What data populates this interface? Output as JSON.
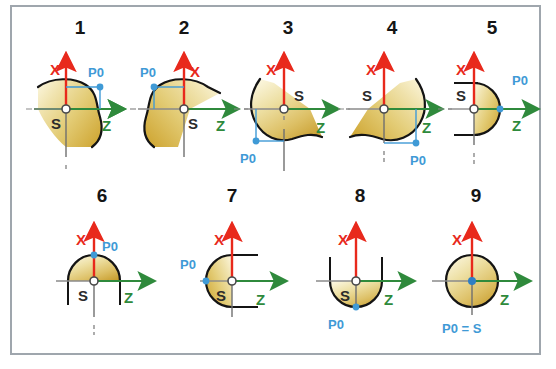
{
  "figure": {
    "panel_count": 9,
    "colors": {
      "x_axis": "#e8291c",
      "z_axis": "#2f8a3c",
      "p0_marker": "#3f9ad6",
      "body_fill_light": "#f5edc2",
      "body_fill_dark": "#d5ae3c",
      "outline": "#1a1a1a",
      "frame_border": "#9fa6ad",
      "background": "#ffffff",
      "dash_line": "#7a7a7a"
    },
    "axis_labels": {
      "x": "X",
      "z": "Z"
    },
    "origin_label": "S",
    "zero_label": "P0",
    "zero_equals_origin_label": "P0 = S"
  },
  "panels": [
    {
      "number": "1",
      "shape": "contour-right-bulge",
      "x_label": "X",
      "z_label": "Z",
      "s_label": "S",
      "p0_label": "P0",
      "p0_position": "upper-right"
    },
    {
      "number": "2",
      "shape": "contour-left-bulge",
      "x_label": "X",
      "z_label": "Z",
      "s_label": "S",
      "p0_label": "P0",
      "p0_position": "upper-left"
    },
    {
      "number": "3",
      "shape": "contour-lower-left",
      "x_label": "X",
      "z_label": "Z",
      "s_label": "S",
      "p0_label": "P0",
      "p0_position": "lower-left"
    },
    {
      "number": "4",
      "shape": "contour-lower-right",
      "x_label": "X",
      "z_label": "Z",
      "s_label": "S",
      "p0_label": "P0",
      "p0_position": "lower-right"
    },
    {
      "number": "5",
      "shape": "half-disc-right",
      "x_label": "X",
      "z_label": "Z",
      "s_label": "S",
      "p0_label": "P0",
      "p0_position": "right-on-z-axis"
    },
    {
      "number": "6",
      "shape": "half-disc-top",
      "x_label": "X",
      "z_label": "Z",
      "s_label": "S",
      "p0_label": "P0",
      "p0_position": "top-on-x-axis"
    },
    {
      "number": "7",
      "shape": "half-disc-left",
      "x_label": "X",
      "z_label": "Z",
      "s_label": "S",
      "p0_label": "P0",
      "p0_position": "left-on-z-axis"
    },
    {
      "number": "8",
      "shape": "half-disc-bottom",
      "x_label": "X",
      "z_label": "Z",
      "s_label": "S",
      "p0_label": "P0",
      "p0_position": "bottom-on-x-axis"
    },
    {
      "number": "9",
      "shape": "full-disc",
      "x_label": "X",
      "z_label": "Z",
      "s_label": "",
      "p0_label": "P0 = S",
      "p0_position": "center"
    }
  ]
}
